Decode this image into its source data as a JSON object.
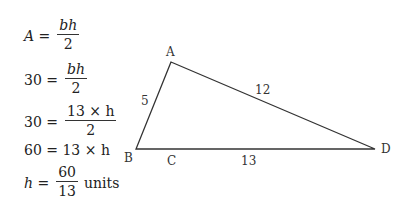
{
  "equations": [
    {
      "lhs": "A =",
      "num": "bh",
      "den": "2",
      "suffix": ""
    },
    {
      "lhs": "30 =",
      "num": "bh",
      "den": "2",
      "suffix": ""
    },
    {
      "lhs": "30 =",
      "num": "13 × h",
      "den": "2",
      "suffix": ""
    },
    {
      "lhs": "60 = 13 × h",
      "num": "",
      "den": "",
      "suffix": ""
    },
    {
      "lhs": "h =",
      "num": "60",
      "den": "13",
      "suffix": "units"
    }
  ],
  "triangle": {
    "vertices": {
      "A": "A",
      "B": "B",
      "C": "C",
      "D": "D"
    },
    "sides": {
      "AB": "5",
      "AD": "12",
      "BD": "13"
    }
  }
}
